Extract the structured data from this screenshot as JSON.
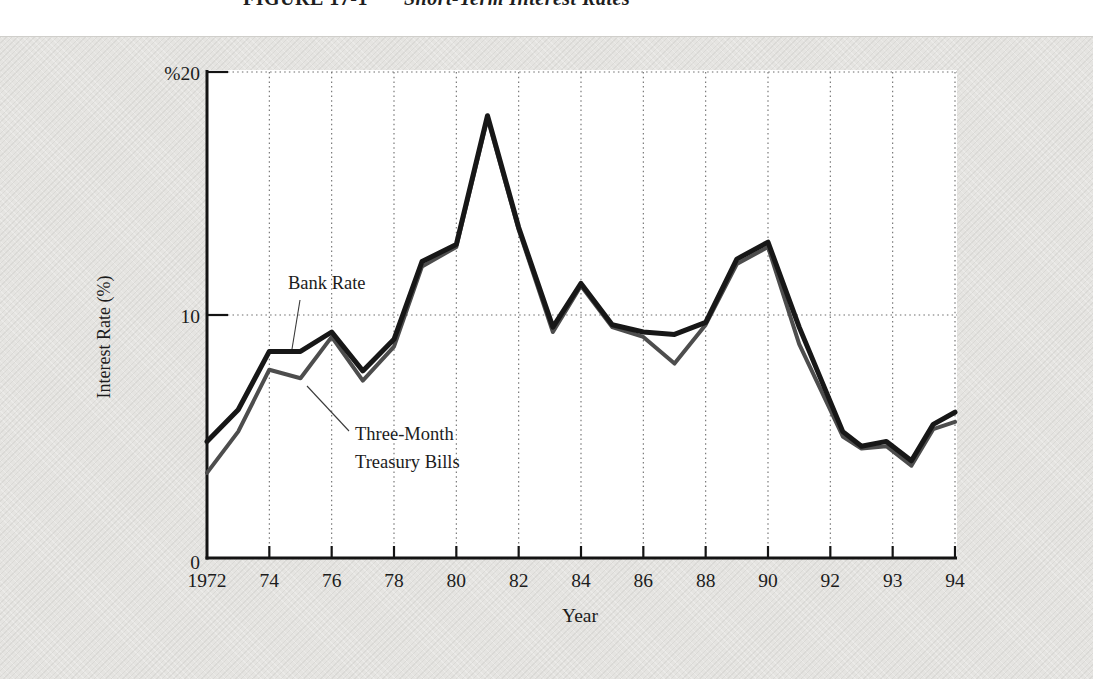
{
  "page": {
    "figure_label": "FIGURE 17-1",
    "figure_title": "Short-Term Interest Rates"
  },
  "chart_data": {
    "type": "line",
    "title": "Short-Term Interest Rates",
    "xlabel": "Year",
    "ylabel": "Interest Rate (%)",
    "ylim": [
      0,
      20
    ],
    "grid": "dotted horizontal lines at 10 and 20; dotted vertical line at every x tick",
    "legend_position": "inline annotations with leader lines",
    "y_ticks": [
      {
        "v": 0,
        "label": "0",
        "grid": false
      },
      {
        "v": 10,
        "label": "10",
        "grid": true
      },
      {
        "v": 20,
        "label": "%20",
        "grid": true
      }
    ],
    "x_ticks": [
      {
        "label": "1972"
      },
      {
        "label": "74"
      },
      {
        "label": "76"
      },
      {
        "label": "78"
      },
      {
        "label": "80"
      },
      {
        "label": "82"
      },
      {
        "label": "84"
      },
      {
        "label": "86"
      },
      {
        "label": "88"
      },
      {
        "label": "90"
      },
      {
        "label": "92"
      },
      {
        "label": "93"
      },
      {
        "label": "94"
      }
    ],
    "series": [
      {
        "name": "Bank Rate",
        "color": "#171717",
        "stroke_width": 5,
        "points": [
          [
            1972,
            4.8
          ],
          [
            1973,
            6.1
          ],
          [
            1974,
            8.5
          ],
          [
            1975,
            8.5
          ],
          [
            1976,
            9.3
          ],
          [
            1977,
            7.7
          ],
          [
            1978,
            9.0
          ],
          [
            1978.9,
            12.2
          ],
          [
            1980,
            12.9
          ],
          [
            1981,
            18.2
          ],
          [
            1982,
            13.6
          ],
          [
            1983.1,
            9.5
          ],
          [
            1984,
            11.3
          ],
          [
            1985,
            9.6
          ],
          [
            1986,
            9.3
          ],
          [
            1987,
            9.2
          ],
          [
            1988,
            9.7
          ],
          [
            1989,
            12.3
          ],
          [
            1990,
            13.0
          ],
          [
            1991,
            9.5
          ],
          [
            1992.2,
            5.2
          ],
          [
            1992.5,
            4.6
          ],
          [
            1992.9,
            4.8
          ],
          [
            1993.3,
            4.0
          ],
          [
            1993.65,
            5.5
          ],
          [
            1994,
            6.0
          ]
        ]
      },
      {
        "name": "Three-Month Treasury Bills",
        "color": "#4d4d4d",
        "stroke_width": 4,
        "points": [
          [
            1972,
            3.5
          ],
          [
            1973,
            5.2
          ],
          [
            1974,
            7.75
          ],
          [
            1975,
            7.4
          ],
          [
            1976,
            9.1
          ],
          [
            1977,
            7.3
          ],
          [
            1978,
            8.7
          ],
          [
            1978.9,
            12.0
          ],
          [
            1980,
            12.8
          ],
          [
            1981,
            18.1
          ],
          [
            1982,
            13.5
          ],
          [
            1983.1,
            9.3
          ],
          [
            1984,
            11.2
          ],
          [
            1985,
            9.5
          ],
          [
            1986,
            9.1
          ],
          [
            1987,
            8.0
          ],
          [
            1988,
            9.6
          ],
          [
            1989,
            12.1
          ],
          [
            1990,
            12.8
          ],
          [
            1991,
            8.8
          ],
          [
            1992.2,
            5.0
          ],
          [
            1992.5,
            4.5
          ],
          [
            1992.9,
            4.6
          ],
          [
            1993.3,
            3.8
          ],
          [
            1993.65,
            5.3
          ],
          [
            1994,
            5.6
          ]
        ]
      }
    ],
    "annotations": [
      {
        "lines": [
          "Bank Rate"
        ]
      },
      {
        "lines": [
          "Three-Month",
          "Treasury Bills"
        ]
      }
    ]
  }
}
